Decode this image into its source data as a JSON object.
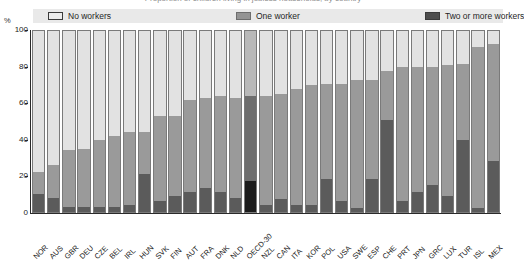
{
  "title_cut": "Proportion of children living in jobless households, by country",
  "axis": {
    "unit": "%",
    "y_ticks": [
      "100",
      "80",
      "60",
      "40",
      "20",
      "0"
    ]
  },
  "legend": {
    "items": [
      {
        "label": "No workers",
        "color": "#e2e2e2",
        "key": "no"
      },
      {
        "label": "One worker",
        "color": "#9a9a9a",
        "key": "one"
      },
      {
        "label": "Two or more workers",
        "color": "#5b5b5b",
        "key": "two"
      }
    ]
  },
  "chart_data": {
    "type": "bar",
    "title": "Proportion of children living in jobless households, by country",
    "xlabel": "",
    "ylabel": "%",
    "ylim": [
      0,
      100
    ],
    "grid": false,
    "stacked": true,
    "normalized_to_100": true,
    "legend_position": "top",
    "highlight_category": "OECD-30",
    "categories": [
      "NOR",
      "AUS",
      "GBR",
      "DEU",
      "CZE",
      "BEL",
      "IRL",
      "HUN",
      "SVK",
      "FIN",
      "AUT",
      "FRA",
      "DNK",
      "NLD",
      "OECD-30",
      "NZL",
      "CAN",
      "ITA",
      "KOR",
      "POL",
      "USA",
      "SWE",
      "ESP",
      "CHE",
      "PRT",
      "JPN",
      "GRC",
      "LUX",
      "TUR",
      "ISL",
      "MEX"
    ],
    "series": [
      {
        "name": "Two or more workers",
        "color": "#5b5b5b",
        "values": [
          10,
          8,
          3,
          3,
          3,
          3,
          4,
          21,
          6,
          9,
          11,
          13,
          11,
          8,
          17,
          4,
          7,
          4,
          4,
          18,
          6,
          2,
          18,
          51,
          6,
          11,
          15,
          9,
          40,
          2,
          28
        ]
      },
      {
        "name": "One worker",
        "color": "#9a9a9a",
        "values": [
          12,
          18,
          31,
          32,
          37,
          39,
          40,
          23,
          47,
          44,
          51,
          50,
          53,
          55,
          47,
          60,
          58,
          64,
          66,
          53,
          65,
          71,
          55,
          27,
          74,
          69,
          65,
          72,
          42,
          89,
          65
        ]
      },
      {
        "name": "No workers",
        "color": "#e2e2e2",
        "values": [
          78,
          74,
          66,
          65,
          60,
          58,
          56,
          56,
          47,
          47,
          38,
          37,
          36,
          37,
          36,
          36,
          35,
          32,
          30,
          29,
          29,
          27,
          27,
          22,
          20,
          20,
          20,
          19,
          18,
          9,
          7
        ]
      }
    ],
    "cumulative_note": "Bars are cumulative to 100%; bottom segment = two or more workers, middle = one worker, top = no workers"
  }
}
